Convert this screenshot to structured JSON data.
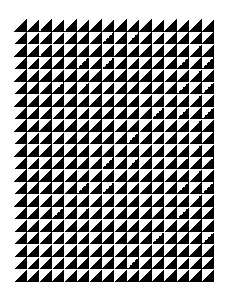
{
  "pattern": {
    "type": "half-square triangle grid",
    "columns": 16,
    "rows": 21,
    "cell_size_px": 12.5,
    "origin": {
      "x": 14,
      "y": 19
    },
    "colors": {
      "fill": "#000000",
      "background": "#ffffff"
    },
    "orientation": "black lower-right triangle, white upper-left triangle"
  }
}
